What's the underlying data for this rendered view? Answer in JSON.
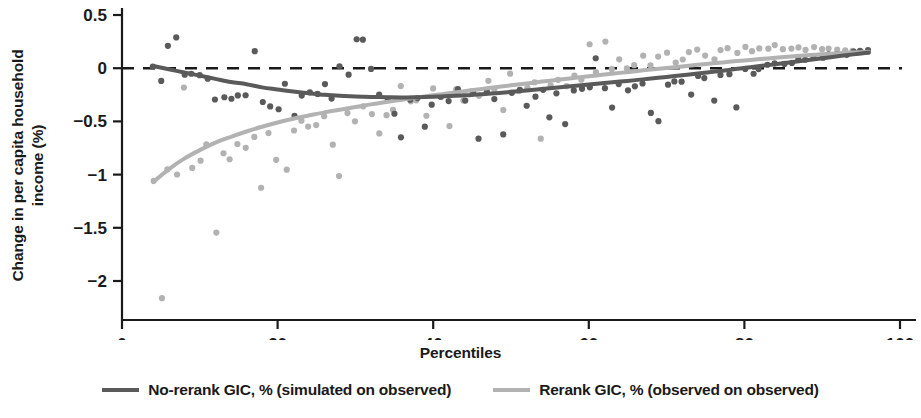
{
  "chart_data": {
    "type": "scatter",
    "title": "",
    "xlabel": "Percentiles",
    "ylabel_lines": [
      "Change in per capita household",
      "income (%)"
    ],
    "ylabel": "Change in per capita household income (%)",
    "xlim": [
      0,
      100
    ],
    "ylim": [
      -2.3,
      0.55
    ],
    "xticks": [
      0,
      20,
      40,
      60,
      80,
      100
    ],
    "xtick_labels": [
      "0",
      "20",
      "40",
      "60",
      "80",
      "100"
    ],
    "yticks": [
      0.5,
      0,
      -0.5,
      -1,
      -1.5,
      -2
    ],
    "ytick_labels": [
      "0.5",
      "0",
      "−0.5",
      "−1",
      "−1.5",
      "−2"
    ],
    "grid": false,
    "zero_reference_line": {
      "value": 0,
      "style": "dashed",
      "color": "#1a1a1a"
    },
    "legend_position": "bottom",
    "colors": {
      "no_rerank": "#5a5a5a",
      "rerank": "#b2b2b2",
      "axis": "#1a1a1a",
      "background": "#ffffff"
    },
    "series": [
      {
        "name": "No-rerank GIC, % (simulated on observed)",
        "color": "#5a5a5a",
        "fit_label": "smoothed fit",
        "fit_x": [
          4,
          6,
          8,
          10,
          12,
          14,
          16,
          18,
          20,
          22,
          24,
          26,
          28,
          30,
          32,
          34,
          36,
          38,
          40,
          42,
          44,
          46,
          48,
          50,
          52,
          54,
          56,
          58,
          60,
          62,
          64,
          66,
          68,
          70,
          72,
          74,
          76,
          78,
          80,
          82,
          84,
          86,
          88,
          90,
          92,
          94,
          96
        ],
        "fit_y": [
          0.02,
          -0.01,
          -0.04,
          -0.07,
          -0.1,
          -0.13,
          -0.15,
          -0.18,
          -0.2,
          -0.22,
          -0.235,
          -0.25,
          -0.26,
          -0.265,
          -0.27,
          -0.273,
          -0.275,
          -0.272,
          -0.268,
          -0.262,
          -0.255,
          -0.245,
          -0.235,
          -0.222,
          -0.21,
          -0.196,
          -0.182,
          -0.168,
          -0.154,
          -0.14,
          -0.126,
          -0.112,
          -0.097,
          -0.082,
          -0.066,
          -0.05,
          -0.033,
          -0.016,
          0.002,
          0.02,
          0.038,
          0.056,
          0.075,
          0.094,
          0.112,
          0.13,
          0.148
        ],
        "points_x": [
          4,
          5,
          6,
          7,
          8,
          9,
          10,
          11,
          12,
          13,
          14,
          15,
          16,
          17,
          18,
          19,
          20,
          21,
          22,
          23,
          24,
          25,
          26,
          27,
          28,
          29,
          30,
          31,
          32,
          33,
          34,
          35,
          36,
          37,
          38,
          39,
          40,
          41,
          42,
          43,
          44,
          45,
          46,
          47,
          48,
          49,
          50,
          51,
          52,
          53,
          54,
          55,
          56,
          57,
          58,
          59,
          60,
          61,
          62,
          63,
          64,
          65,
          66,
          67,
          68,
          69,
          70,
          71,
          72,
          73,
          74,
          75,
          76,
          77,
          78,
          79,
          80,
          81,
          82,
          83,
          84,
          85,
          86,
          87,
          88,
          89,
          90,
          91,
          92,
          93,
          94,
          95,
          96
        ],
        "points_y": [
          0.02,
          -0.12,
          0.21,
          0.3,
          -0.06,
          -0.05,
          -0.08,
          -0.1,
          -0.3,
          -0.28,
          -0.3,
          -0.25,
          -0.26,
          0.15,
          -0.31,
          -0.36,
          -0.38,
          -0.16,
          -0.45,
          -0.26,
          -0.24,
          -0.25,
          -0.16,
          -0.28,
          0.02,
          -0.05,
          0.28,
          0.26,
          -0.02,
          -0.26,
          -0.3,
          -0.42,
          -0.66,
          -0.3,
          -0.27,
          -0.55,
          -0.35,
          -0.28,
          -0.3,
          -0.19,
          -0.31,
          -0.24,
          -0.66,
          -0.21,
          -0.28,
          -0.63,
          -0.23,
          -0.2,
          -0.34,
          -0.26,
          -0.21,
          -0.46,
          -0.24,
          -0.52,
          -0.22,
          -0.19,
          -0.17,
          0.09,
          -0.18,
          -0.38,
          -0.14,
          -0.2,
          -0.16,
          -0.13,
          -0.42,
          -0.5,
          -0.15,
          -0.12,
          -0.13,
          -0.26,
          -0.08,
          -0.09,
          -0.3,
          -0.06,
          -0.05,
          -0.36,
          -0.02,
          -0.04,
          0.0,
          0.02,
          0.04,
          0.03,
          0.06,
          0.07,
          0.08,
          0.1,
          0.11,
          0.12,
          0.13,
          0.14,
          0.15,
          0.15,
          0.16
        ]
      },
      {
        "name": "Rerank GIC, % (observed on observed)",
        "color": "#b2b2b2",
        "fit_label": "smoothed fit",
        "fit_x": [
          4,
          6,
          8,
          10,
          12,
          14,
          16,
          18,
          20,
          22,
          24,
          26,
          28,
          30,
          32,
          34,
          36,
          38,
          40,
          42,
          44,
          46,
          48,
          50,
          52,
          54,
          56,
          58,
          60,
          62,
          64,
          66,
          68,
          70,
          72,
          74,
          76,
          78,
          80,
          82,
          84,
          86,
          88,
          90,
          92,
          94,
          96
        ],
        "fit_y": [
          -1.07,
          -0.95,
          -0.85,
          -0.77,
          -0.7,
          -0.645,
          -0.595,
          -0.55,
          -0.51,
          -0.475,
          -0.445,
          -0.415,
          -0.39,
          -0.365,
          -0.34,
          -0.318,
          -0.296,
          -0.275,
          -0.255,
          -0.235,
          -0.216,
          -0.197,
          -0.179,
          -0.161,
          -0.143,
          -0.126,
          -0.109,
          -0.092,
          -0.076,
          -0.06,
          -0.044,
          -0.028,
          -0.013,
          0.002,
          0.017,
          0.032,
          0.046,
          0.06,
          0.073,
          0.086,
          0.098,
          0.11,
          0.121,
          0.131,
          0.14,
          0.148,
          0.155
        ],
        "points_x": [
          4,
          5,
          6,
          7,
          8,
          9,
          10,
          11,
          12,
          13,
          14,
          15,
          16,
          17,
          18,
          19,
          20,
          21,
          22,
          23,
          24,
          25,
          26,
          27,
          28,
          29,
          30,
          31,
          32,
          33,
          34,
          35,
          36,
          37,
          38,
          39,
          40,
          41,
          42,
          43,
          44,
          45,
          46,
          47,
          48,
          49,
          50,
          51,
          52,
          53,
          54,
          55,
          56,
          57,
          58,
          59,
          60,
          61,
          62,
          63,
          64,
          65,
          66,
          67,
          68,
          69,
          70,
          71,
          72,
          73,
          74,
          75,
          76,
          77,
          78,
          79,
          80,
          81,
          82,
          83,
          84,
          85,
          86,
          87,
          88,
          89,
          90,
          91,
          92,
          93,
          94,
          95,
          96
        ],
        "points_y": [
          -1.05,
          -2.15,
          -0.96,
          -1.0,
          -0.18,
          -0.93,
          -0.87,
          -0.73,
          -1.55,
          -0.8,
          -0.86,
          -0.7,
          -0.74,
          -0.64,
          -1.12,
          -0.62,
          -0.87,
          -0.94,
          -0.58,
          -0.49,
          -0.55,
          -0.53,
          -0.44,
          -0.72,
          -1.0,
          -0.42,
          -0.5,
          -0.36,
          -0.44,
          -0.6,
          -0.43,
          -0.4,
          -0.17,
          -0.32,
          -0.31,
          -0.45,
          -0.2,
          -0.28,
          -0.53,
          -0.21,
          -0.3,
          -0.22,
          -0.26,
          -0.12,
          -0.2,
          -0.4,
          -0.05,
          -0.22,
          -0.18,
          -0.14,
          -0.66,
          -0.17,
          -0.1,
          -0.16,
          -0.08,
          -0.12,
          0.23,
          -0.05,
          0.25,
          -0.02,
          0.07,
          0.0,
          0.04,
          0.12,
          0.02,
          0.1,
          0.14,
          0.05,
          0.08,
          0.15,
          0.17,
          0.11,
          0.09,
          0.16,
          0.18,
          0.13,
          0.19,
          0.15,
          0.2,
          0.17,
          0.21,
          0.19,
          0.18,
          0.2,
          0.16,
          0.19,
          0.17,
          0.18,
          0.16,
          0.17,
          0.15,
          0.16,
          0.15
        ]
      }
    ]
  },
  "legend": {
    "items": [
      {
        "label": "No-rerank GIC, % (simulated on observed)",
        "color": "#5a5a5a"
      },
      {
        "label": "Rerank GIC, % (observed on observed)",
        "color": "#b2b2b2"
      }
    ]
  }
}
